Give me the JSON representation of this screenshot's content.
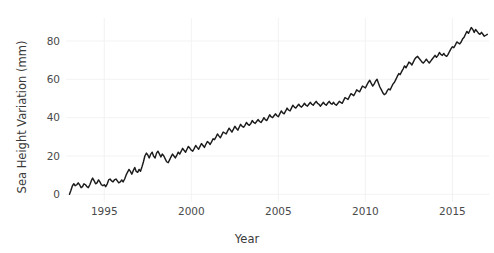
{
  "chart_data": {
    "type": "line",
    "title": "",
    "xlabel": "Year",
    "ylabel": "Sea Height Variation (mm)",
    "xlim": [
      1992.8,
      2017.1
    ],
    "ylim": [
      -4,
      92
    ],
    "xticks": [
      1995,
      2000,
      2005,
      2010,
      2015
    ],
    "xticklabels": [
      "1995",
      "2000",
      "2005",
      "2010",
      "2015"
    ],
    "yticks": [
      0,
      20,
      40,
      60,
      80
    ],
    "yticklabels": [
      "0",
      "20",
      "40",
      "60",
      "80"
    ],
    "grid": true,
    "legend": null,
    "line_color": "#1c1c1c",
    "grid_color": "#f0f0f0",
    "background_color": "#ffffff",
    "series": [
      {
        "name": "Sea Height Variation",
        "x": [
          1993.0,
          1993.08,
          1993.17,
          1993.25,
          1993.33,
          1993.42,
          1993.5,
          1993.58,
          1993.67,
          1993.75,
          1993.83,
          1993.92,
          1994.0,
          1994.08,
          1994.17,
          1994.25,
          1994.33,
          1994.42,
          1994.5,
          1994.58,
          1994.67,
          1994.75,
          1994.83,
          1994.92,
          1995.0,
          1995.08,
          1995.17,
          1995.25,
          1995.33,
          1995.42,
          1995.5,
          1995.58,
          1995.67,
          1995.75,
          1995.83,
          1995.92,
          1996.0,
          1996.08,
          1996.17,
          1996.25,
          1996.33,
          1996.42,
          1996.5,
          1996.58,
          1996.67,
          1996.75,
          1996.83,
          1996.92,
          1997.0,
          1997.08,
          1997.17,
          1997.25,
          1997.33,
          1997.42,
          1997.5,
          1997.58,
          1997.67,
          1997.75,
          1997.83,
          1997.92,
          1998.0,
          1998.08,
          1998.17,
          1998.25,
          1998.33,
          1998.42,
          1998.5,
          1998.58,
          1998.67,
          1998.75,
          1998.83,
          1998.92,
          1999.0,
          1999.08,
          1999.17,
          1999.25,
          1999.33,
          1999.42,
          1999.5,
          1999.58,
          1999.67,
          1999.75,
          1999.83,
          1999.92,
          2000.0,
          2000.08,
          2000.17,
          2000.25,
          2000.33,
          2000.42,
          2000.5,
          2000.58,
          2000.67,
          2000.75,
          2000.83,
          2000.92,
          2001.0,
          2001.08,
          2001.17,
          2001.25,
          2001.33,
          2001.42,
          2001.5,
          2001.58,
          2001.67,
          2001.75,
          2001.83,
          2001.92,
          2002.0,
          2002.08,
          2002.17,
          2002.25,
          2002.33,
          2002.42,
          2002.5,
          2002.58,
          2002.67,
          2002.75,
          2002.83,
          2002.92,
          2003.0,
          2003.08,
          2003.17,
          2003.25,
          2003.33,
          2003.42,
          2003.5,
          2003.58,
          2003.67,
          2003.75,
          2003.83,
          2003.92,
          2004.0,
          2004.08,
          2004.17,
          2004.25,
          2004.33,
          2004.42,
          2004.5,
          2004.58,
          2004.67,
          2004.75,
          2004.83,
          2004.92,
          2005.0,
          2005.08,
          2005.17,
          2005.25,
          2005.33,
          2005.42,
          2005.5,
          2005.58,
          2005.67,
          2005.75,
          2005.83,
          2005.92,
          2006.0,
          2006.08,
          2006.17,
          2006.25,
          2006.33,
          2006.42,
          2006.5,
          2006.58,
          2006.67,
          2006.75,
          2006.83,
          2006.92,
          2007.0,
          2007.08,
          2007.17,
          2007.25,
          2007.33,
          2007.42,
          2007.5,
          2007.58,
          2007.67,
          2007.75,
          2007.83,
          2007.92,
          2008.0,
          2008.08,
          2008.17,
          2008.25,
          2008.33,
          2008.42,
          2008.5,
          2008.58,
          2008.67,
          2008.75,
          2008.83,
          2008.92,
          2009.0,
          2009.08,
          2009.17,
          2009.25,
          2009.33,
          2009.42,
          2009.5,
          2009.58,
          2009.67,
          2009.75,
          2009.83,
          2009.92,
          2010.0,
          2010.08,
          2010.17,
          2010.25,
          2010.33,
          2010.42,
          2010.5,
          2010.58,
          2010.67,
          2010.75,
          2010.83,
          2010.92,
          2011.0,
          2011.08,
          2011.17,
          2011.25,
          2011.33,
          2011.42,
          2011.5,
          2011.58,
          2011.67,
          2011.75,
          2011.83,
          2011.92,
          2012.0,
          2012.08,
          2012.17,
          2012.25,
          2012.33,
          2012.42,
          2012.5,
          2012.58,
          2012.67,
          2012.75,
          2012.83,
          2012.92,
          2013.0,
          2013.08,
          2013.17,
          2013.25,
          2013.33,
          2013.42,
          2013.5,
          2013.58,
          2013.67,
          2013.75,
          2013.83,
          2013.92,
          2014.0,
          2014.08,
          2014.17,
          2014.25,
          2014.33,
          2014.42,
          2014.5,
          2014.58,
          2014.67,
          2014.75,
          2014.83,
          2014.92,
          2015.0,
          2015.08,
          2015.17,
          2015.25,
          2015.33,
          2015.42,
          2015.5,
          2015.58,
          2015.67,
          2015.75,
          2015.83,
          2015.92,
          2016.0,
          2016.08,
          2016.17,
          2016.25,
          2016.33,
          2016.42,
          2016.5,
          2016.58,
          2016.67,
          2016.75,
          2016.83,
          2016.92,
          2017.0
        ],
        "y": [
          0.0,
          2.0,
          4.5,
          5.5,
          4.5,
          5.0,
          6.0,
          5.0,
          3.5,
          4.0,
          5.5,
          5.0,
          4.0,
          3.5,
          5.0,
          7.0,
          8.5,
          7.0,
          5.5,
          6.0,
          7.5,
          6.5,
          5.0,
          4.5,
          5.0,
          4.0,
          5.5,
          7.5,
          8.0,
          7.0,
          6.5,
          7.5,
          8.0,
          7.0,
          6.0,
          6.5,
          7.5,
          6.5,
          8.0,
          10.0,
          11.5,
          13.0,
          12.0,
          10.5,
          12.5,
          14.0,
          12.0,
          11.5,
          13.0,
          12.0,
          14.5,
          17.0,
          20.0,
          21.5,
          20.5,
          19.0,
          21.0,
          22.0,
          20.0,
          19.0,
          21.5,
          22.5,
          21.0,
          19.5,
          21.0,
          20.0,
          18.5,
          17.0,
          16.5,
          18.0,
          19.5,
          21.0,
          20.0,
          19.0,
          20.5,
          22.0,
          21.0,
          22.5,
          24.0,
          23.0,
          22.0,
          23.5,
          25.0,
          24.0,
          23.0,
          22.5,
          24.0,
          25.5,
          24.5,
          23.5,
          25.0,
          26.5,
          25.5,
          24.5,
          26.0,
          27.5,
          27.0,
          26.0,
          27.5,
          29.0,
          28.5,
          30.0,
          31.5,
          30.5,
          29.5,
          31.0,
          32.5,
          32.0,
          31.5,
          33.0,
          34.5,
          33.5,
          32.5,
          34.0,
          35.5,
          34.5,
          33.5,
          35.0,
          36.5,
          35.5,
          35.0,
          36.0,
          37.5,
          36.5,
          36.0,
          37.0,
          38.5,
          37.5,
          37.0,
          38.0,
          39.0,
          38.0,
          37.5,
          38.5,
          40.0,
          39.0,
          38.5,
          40.0,
          41.5,
          40.5,
          40.0,
          41.0,
          42.0,
          41.0,
          40.5,
          42.0,
          43.5,
          42.5,
          42.0,
          43.5,
          45.0,
          44.0,
          43.5,
          45.0,
          46.5,
          45.5,
          45.0,
          46.0,
          47.0,
          46.0,
          45.5,
          46.5,
          47.5,
          46.5,
          46.0,
          47.0,
          48.0,
          47.0,
          46.5,
          47.5,
          48.5,
          47.5,
          47.0,
          46.0,
          47.0,
          48.0,
          47.0,
          46.5,
          47.5,
          48.5,
          47.5,
          47.0,
          48.0,
          47.0,
          46.5,
          47.5,
          48.5,
          48.0,
          47.5,
          49.0,
          50.5,
          50.0,
          49.5,
          51.0,
          52.5,
          52.0,
          51.5,
          53.0,
          54.5,
          54.0,
          53.5,
          55.0,
          56.5,
          56.0,
          55.5,
          57.0,
          58.5,
          59.5,
          58.0,
          56.5,
          57.5,
          59.0,
          60.0,
          58.0,
          56.0,
          54.5,
          53.0,
          52.0,
          52.5,
          54.0,
          55.0,
          54.5,
          56.0,
          57.5,
          58.5,
          60.0,
          61.5,
          63.0,
          62.5,
          64.0,
          65.5,
          67.0,
          66.0,
          67.5,
          69.0,
          68.5,
          67.5,
          69.0,
          70.5,
          71.5,
          72.0,
          71.0,
          70.0,
          69.0,
          68.5,
          69.5,
          70.5,
          69.5,
          68.5,
          69.5,
          70.5,
          71.5,
          72.5,
          71.5,
          72.5,
          74.0,
          73.0,
          72.5,
          73.5,
          72.5,
          72.0,
          73.0,
          74.5,
          76.0,
          77.0,
          76.5,
          78.0,
          79.5,
          79.0,
          78.5,
          79.5,
          81.0,
          82.0,
          83.5,
          85.0,
          84.0,
          85.5,
          87.0,
          86.0,
          84.5,
          86.0,
          85.0,
          84.0,
          83.5,
          84.5,
          83.5,
          82.5,
          83.0,
          83.5
        ]
      }
    ]
  },
  "labels": {
    "ylabel": "Sea Height Variation (mm)",
    "xlabel": "Year"
  }
}
